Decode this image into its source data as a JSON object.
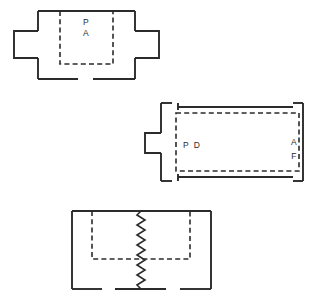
{
  "drawing": {
    "title": "Technical line drawing with three sectional figures",
    "background_color": "#ffffff",
    "stroke_color": "#2b2b2b",
    "width": 318,
    "height": 301
  },
  "figures": [
    {
      "id": "figure-1",
      "name": "upper-assembly-view",
      "description": "Rectangular body with symmetric side projections and a dashed internal chamber open at the top",
      "labels": [
        {
          "name": "label-p",
          "text": "P",
          "x": 86,
          "y": 25
        },
        {
          "name": "label-a",
          "text": "A",
          "x": 86,
          "y": 36
        }
      ],
      "geometry": {
        "outer_rect": {
          "x": 38,
          "y": 11,
          "width": 97,
          "height": 68
        },
        "inner_dashed_rect": {
          "x": 60,
          "y": 11,
          "width": 53,
          "height": 53
        },
        "left_projection": {
          "x": 14,
          "y": 31,
          "width": 24,
          "height": 27
        },
        "right_projection": {
          "x": 135,
          "y": 31,
          "width": 24,
          "height": 27
        },
        "bottom_gap": {
          "start": 78,
          "end": 93
        }
      }
    },
    {
      "id": "figure-2",
      "name": "middle-elongated-view",
      "description": "Elongated rectangular body with corner break gaps, a single left side projection and a dashed internal cavity",
      "labels": [
        {
          "name": "label-p",
          "text": "P",
          "x": 186,
          "y": 148
        },
        {
          "name": "label-d",
          "text": "D",
          "x": 196,
          "y": 148
        },
        {
          "name": "label-a",
          "text": "A",
          "x": 294,
          "y": 144
        },
        {
          "name": "label-f",
          "text": "F",
          "x": 294,
          "y": 158
        }
      ],
      "geometry": {
        "outer_rect": {
          "x": 161,
          "y": 103,
          "width": 142,
          "height": 78
        },
        "inner_dashed_rect": {
          "x": 176,
          "y": 113,
          "width": 123,
          "height": 58
        },
        "left_projection": {
          "x": 145,
          "y": 133,
          "width": 16,
          "height": 20
        }
      }
    },
    {
      "id": "figure-3",
      "name": "lower-break-view",
      "description": "Rectangular body with dashed internal chamber and a vertical zigzag break line through the centre",
      "labels": [],
      "geometry": {
        "outer_rect": {
          "x": 72,
          "y": 211,
          "width": 139,
          "height": 78
        },
        "inner_dashed_rect": {
          "x": 92,
          "y": 211,
          "width": 98,
          "height": 48
        },
        "zigzag": {
          "x": 141,
          "y_top": 211,
          "y_bottom": 289,
          "amplitude": 4,
          "segments": 16
        },
        "bottom_gaps": [
          {
            "start": 102,
            "end": 115
          },
          {
            "start": 166,
            "end": 180
          }
        ]
      }
    }
  ]
}
